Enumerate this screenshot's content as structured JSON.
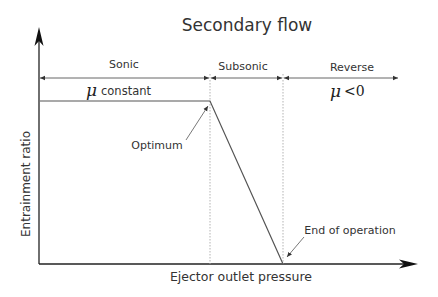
{
  "diagram": {
    "title": "Secondary flow",
    "x_axis_label": "Ejector outlet pressure",
    "y_axis_label": "Entrainment ratio",
    "regions": [
      {
        "label": "Sonic"
      },
      {
        "label": "Subsonic"
      },
      {
        "label": "Reverse"
      }
    ],
    "annotations": {
      "mu_symbol": "μ",
      "mu_constant": "constant",
      "mu_negative": "<0",
      "optimum": "Optimum",
      "end_of_operation": "End of operation"
    },
    "colors": {
      "line": "#555555",
      "axis": "#222222",
      "text": "#333333",
      "dashed": "#aaaaaa"
    }
  }
}
